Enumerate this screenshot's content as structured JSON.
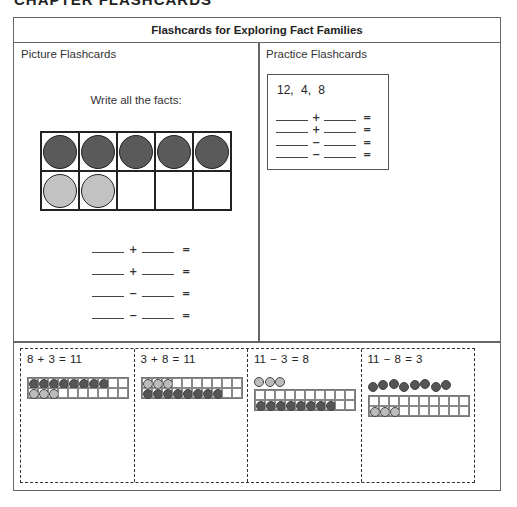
{
  "page": {
    "cut_title": "CHAPTER FLASHCARDS"
  },
  "table": {
    "title": "Flashcards for Exploring Fact Families",
    "left_panel": {
      "label": "Picture Flashcards",
      "prompt": "Write all the facts:",
      "ten_frame": {
        "columns": 5,
        "rows": 2,
        "dark_count": 5,
        "light_count": 2,
        "dark_color": "#5a5a5a",
        "light_color": "#c2c2c2"
      },
      "equations": [
        {
          "op": "+",
          "eq": "="
        },
        {
          "op": "+",
          "eq": "="
        },
        {
          "op": "−",
          "eq": "="
        },
        {
          "op": "−",
          "eq": "="
        }
      ]
    },
    "right_panel": {
      "label": "Practice Flashcards",
      "numbers": "12,  4,   8",
      "equations": [
        {
          "op": "+",
          "eq": "="
        },
        {
          "op": "+",
          "eq": "="
        },
        {
          "op": "−",
          "eq": "="
        },
        {
          "op": "−",
          "eq": "="
        }
      ]
    },
    "fact_cards": [
      {
        "equation": "8 + 3 = 11",
        "frame_row1": {
          "dark": 8
        },
        "frame_row2": {
          "light": 3
        },
        "above_frame": null
      },
      {
        "equation": "3 + 8 = 11",
        "frame_row1": {
          "light": 3
        },
        "frame_row2": {
          "dark": 8
        },
        "above_frame": null
      },
      {
        "equation": "11 − 3 = 8",
        "frame_row1": {},
        "frame_row2": {
          "dark": 8
        },
        "above_frame": {
          "light": 3
        }
      },
      {
        "equation": "11 − 8 = 3",
        "frame_row1": {},
        "frame_row2": {
          "light": 3
        },
        "above_frame": {
          "dark": 8
        }
      }
    ]
  }
}
